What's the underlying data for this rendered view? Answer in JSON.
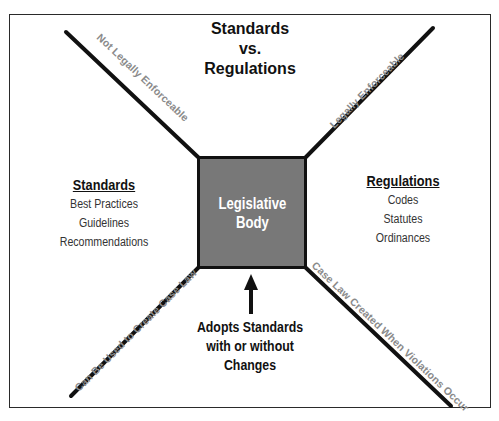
{
  "diagram": {
    "title_lines": [
      "Standards",
      "vs.",
      "Regulations"
    ],
    "center_box": {
      "label": "Legislative\nBody",
      "fill_color": "#787878",
      "text_color": "#ffffff"
    },
    "standards": {
      "heading": "Standards",
      "items": [
        "Best Practices",
        "Guidelines",
        "Recommendations"
      ]
    },
    "regulations": {
      "heading": "Regulations",
      "items": [
        "Codes",
        "Statutes",
        "Ordinances"
      ]
    },
    "adopts_note": {
      "lines": [
        "Adopts Standards",
        "with or without",
        "Changes"
      ]
    },
    "diagonal_labels": {
      "top_left": "Not Legally Enforceable",
      "top_right": "Legally Enforceable",
      "bottom_left": "Can Be Used to Create Case Law",
      "bottom_right": "Case Law Created When Violations Occur"
    },
    "colors": {
      "line": "#111111",
      "diagonal_text": "#8a8a8a",
      "border": "#2a2a2a"
    }
  }
}
